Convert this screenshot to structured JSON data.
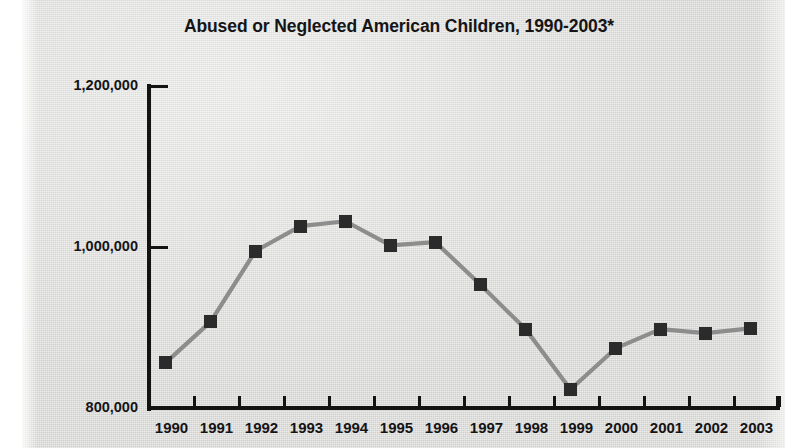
{
  "chart_data": {
    "type": "line",
    "title": "Abused or Neglected American Children, 1990-2003*",
    "xlabel": "",
    "ylabel": "",
    "categories": [
      "1990",
      "1991",
      "1992",
      "1993",
      "1994",
      "1995",
      "1996",
      "1997",
      "1998",
      "1999",
      "2000",
      "2001",
      "2002",
      "2003"
    ],
    "values": [
      856000,
      907000,
      995000,
      1026000,
      1032000,
      1002000,
      1006000,
      953000,
      898000,
      823000,
      874000,
      898000,
      893000,
      899000
    ],
    "series": [
      {
        "name": "Abused or neglected children",
        "values": [
          856000,
          907000,
          995000,
          1026000,
          1032000,
          1002000,
          1006000,
          953000,
          898000,
          823000,
          874000,
          898000,
          893000,
          899000
        ]
      }
    ],
    "ylim": [
      800000,
      1200000
    ],
    "ytick_labels": [
      "1,200,000",
      "1,000,000",
      "800,000"
    ],
    "ytick_values": [
      1200000,
      1000000,
      800000
    ],
    "grid": false,
    "legend": "none",
    "marker": "square",
    "colors": {
      "line": "#8d8d8d",
      "marker": "#2b2b2b",
      "axis": "#131313",
      "text": "#141414",
      "background": "#d9d9d6"
    }
  }
}
